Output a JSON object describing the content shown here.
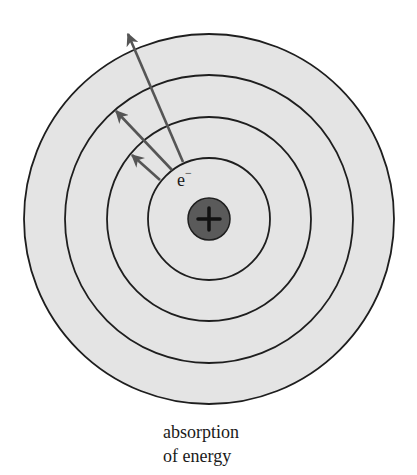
{
  "diagram": {
    "center": {
      "x": 209,
      "y": 219
    },
    "orbit_radii": [
      61,
      102,
      144,
      185
    ],
    "orbit_fill": "#e4e4e4",
    "orbit_stroke": "#1e1e1e",
    "nucleus": {
      "radius": 21,
      "fill": "#5a5a5a",
      "symbol": "+"
    },
    "electron_label": {
      "symbol": "e",
      "charge": "−"
    },
    "arrow_color": "#555555",
    "arrows": [
      {
        "from_orbit": 1,
        "to_orbit": 2,
        "x1": 160,
        "y1": 180,
        "x2": 132,
        "y2": 155
      },
      {
        "from_orbit": 1,
        "to_orbit": 3,
        "x1": 172,
        "y1": 170,
        "x2": 116,
        "y2": 111
      },
      {
        "from_orbit": 1,
        "to_orbit": 4,
        "x1": 183,
        "y1": 162,
        "x2": 128,
        "y2": 34
      }
    ]
  },
  "caption": {
    "line1": "absorption",
    "line2": "of energy"
  }
}
